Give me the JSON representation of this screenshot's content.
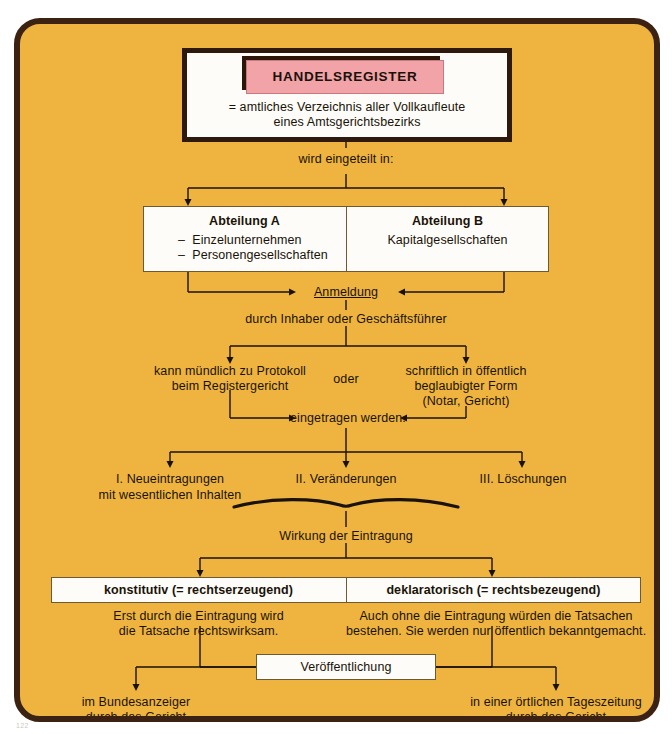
{
  "diagram": {
    "title": "HANDELSREGISTER",
    "subtitle_line1": "= amtliches Verzeichnis aller Vollkaufleute",
    "subtitle_line2": "eines Amtsgerichtsbezirks",
    "colors": {
      "background": "#eeb43f",
      "frame_border": "#3b2212",
      "banner_pink": "#f2a3a8",
      "box_white": "#fdfcf8",
      "text": "#1a1208"
    },
    "connector_label_divide": "wird eingeteilt in:",
    "departments": [
      {
        "heading": "Abteilung A",
        "items": [
          "–  Einzelunternehmen",
          "–  Personengesellschaften"
        ]
      },
      {
        "heading": "Abteilung B",
        "items": [
          "Kapitalgesellschaften"
        ]
      }
    ],
    "registration": {
      "label": "Anmeldung",
      "by": "durch Inhaber oder Geschäftsführer",
      "option_left_line1": "kann mündlich zu Protokoll",
      "option_left_line2": "beim Registergericht",
      "conjunction": "oder",
      "option_right_line1": "schriftlich in öffentlich",
      "option_right_line2": "beglaubigter Form",
      "option_right_line3": "(Notar, Gericht)",
      "result": "eingetragen werden."
    },
    "entry_types": [
      {
        "label_line1": "I. Neueintragungen",
        "label_line2": "mit wesentlichen Inhalten"
      },
      {
        "label_line1": "II. Veränderungen",
        "label_line2": ""
      },
      {
        "label_line1": "III. Löschungen",
        "label_line2": ""
      }
    ],
    "effect_label": "Wirkung der Eintragung",
    "effects": [
      {
        "heading": "konstitutiv (= rechtserzeugend)",
        "desc_line1": "Erst durch die Eintragung wird",
        "desc_line2": "die Tatsache rechtswirksam."
      },
      {
        "heading": "deklaratorisch (= rechtsbezeugend)",
        "desc_line1": "Auch ohne die Eintragung würden die Tatsachen",
        "desc_line2": "bestehen. Sie werden nur öffentlich bekanntgemacht."
      }
    ],
    "publication": {
      "label": "Veröffentlichung",
      "left_line1": "im Bundesanzeiger",
      "left_line2": "durch das Gericht",
      "right_line1": "in einer örtlichen Tageszeitung",
      "right_line2": "durch das Gericht"
    },
    "page_artifact": "122"
  }
}
